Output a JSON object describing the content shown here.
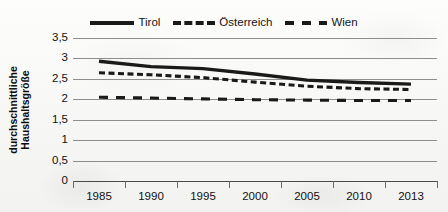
{
  "chart_data": {
    "type": "line",
    "title": "",
    "xlabel": "",
    "ylabel": "durchschnittliche Haushaltsgröße",
    "ylabel_line1": "durchschnittliche",
    "ylabel_line2": "Haushaltsgröße",
    "categories": [
      "1985",
      "1990",
      "1995",
      "2000",
      "2005",
      "2010",
      "2013"
    ],
    "x_tick_labels": [
      "1985",
      "1990",
      "1995",
      "2000",
      "2005",
      "2010",
      "2013"
    ],
    "y_tick_labels": [
      "3,5",
      "3",
      "2,5",
      "2",
      "1,5",
      "1",
      "0,5",
      "0"
    ],
    "y_tick_values": [
      3.5,
      3,
      2.5,
      2,
      1.5,
      1,
      0.5,
      0
    ],
    "ylim": [
      0,
      3.5
    ],
    "grid": true,
    "legend_position": "top-center",
    "series": [
      {
        "name": "Tirol",
        "style": "solid",
        "color": "#1a1a1a",
        "values": [
          2.93,
          2.8,
          2.75,
          2.62,
          2.47,
          2.41,
          2.37
        ]
      },
      {
        "name": "Österreich",
        "style": "short-dash",
        "color": "#1a1a1a",
        "values": [
          2.65,
          2.6,
          2.53,
          2.42,
          2.32,
          2.26,
          2.24
        ]
      },
      {
        "name": "Wien",
        "style": "long-dash",
        "color": "#1a1a1a",
        "values": [
          2.05,
          2.03,
          2.01,
          1.99,
          1.98,
          1.97,
          1.97
        ]
      }
    ]
  },
  "legend": {
    "items": [
      {
        "label": "Tirol",
        "swatch": "solid-line-swatch"
      },
      {
        "label": "Österreich",
        "swatch": "short-dashed-line-swatch"
      },
      {
        "label": "Wien",
        "swatch": "long-dashed-line-swatch"
      }
    ]
  },
  "colors": {
    "series": "#1a1a1a",
    "gridline": "#8e8e8e",
    "axis": "#4a4a4a",
    "background": "#fbfbfa",
    "text": "#111111"
  }
}
